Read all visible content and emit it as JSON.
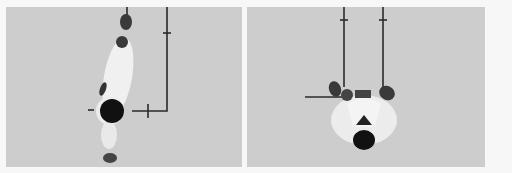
{
  "figure": {
    "panels": [
      {
        "id": "left",
        "description": "Overhead view of figure in white suit lying with arms extended upward; line diagram marking vertical line with tick and L-shaped horizontal segment with cross tick",
        "background": "#cdcdcd",
        "line_color": "#2a2a2a"
      },
      {
        "id": "right",
        "description": "Overhead view of figure in white suit, head down, two hands at top of frame; two vertical lines with ticks and a horizontal line to the left",
        "background": "#cdcdcd",
        "line_color": "#2a2a2a"
      }
    ],
    "page_background": "#f7f7f7"
  }
}
